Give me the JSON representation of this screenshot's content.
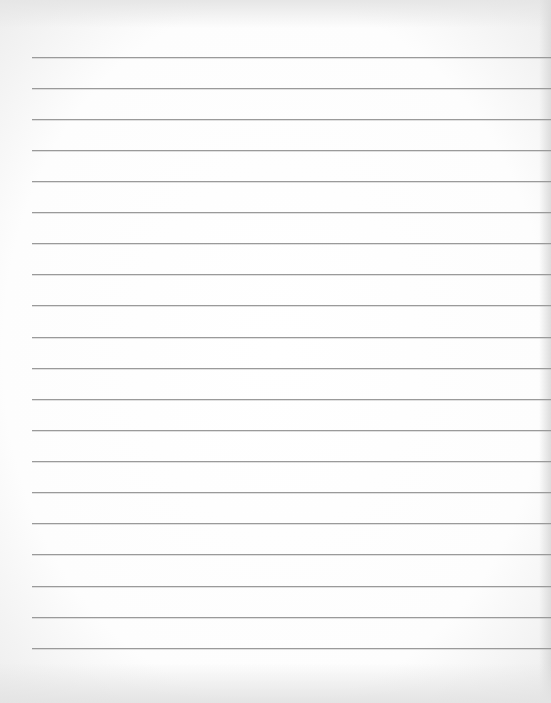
{
  "page": {
    "type": "lined-paper",
    "background": "#fdfdfd",
    "rule_color": "#9a9a9a",
    "rule_left_x": 32,
    "rules_y": [
      57,
      88,
      119,
      150,
      181,
      212,
      243,
      274,
      305,
      337,
      368,
      399,
      430,
      461,
      492,
      523,
      554,
      586,
      617,
      648
    ]
  }
}
